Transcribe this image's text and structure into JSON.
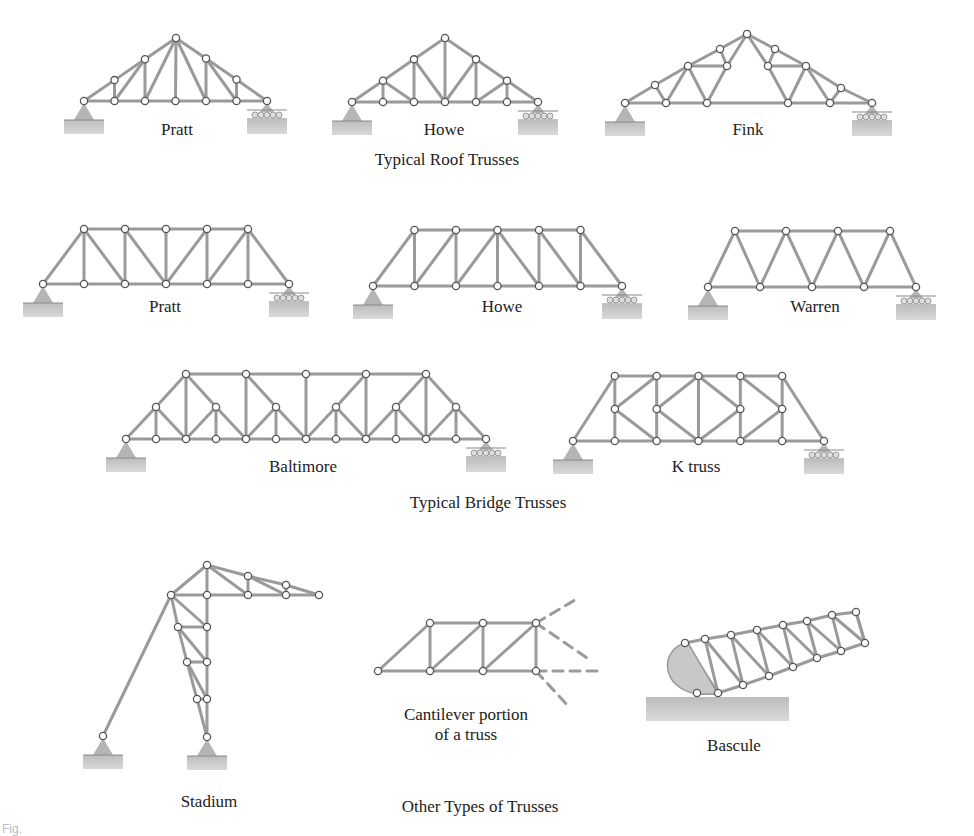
{
  "figure": {
    "caption_fragment": "Fig.",
    "sections": [
      {
        "id": "roof",
        "title": "Typical Roof Trusses",
        "trusses": [
          "Pratt",
          "Howe",
          "Fink"
        ]
      },
      {
        "id": "bridge",
        "title": "Typical Bridge Trusses",
        "trusses": [
          "Pratt",
          "Howe",
          "Warren",
          "Baltimore",
          "K truss"
        ]
      },
      {
        "id": "other",
        "title": "Other Types of Trusses",
        "trusses": [
          "Stadium",
          "Cantilever portion of a truss",
          "Bascule"
        ]
      }
    ]
  },
  "labels": {
    "roof_pratt": "Pratt",
    "roof_howe": "Howe",
    "roof_fink": "Fink",
    "roof_title": "Typical Roof Trusses",
    "bridge_pratt": "Pratt",
    "bridge_howe": "Howe",
    "bridge_warren": "Warren",
    "bridge_baltimore": "Baltimore",
    "bridge_ktruss": "K truss",
    "bridge_title": "Typical Bridge Trusses",
    "stadium": "Stadium",
    "cantilever_line1": "Cantilever portion",
    "cantilever_line2": "of a truss",
    "bascule": "Bascule",
    "other_title": "Other Types of Trusses"
  },
  "colors": {
    "member": "#9a9a9a",
    "joint_fill": "#ffffff",
    "joint_stroke": "#555555",
    "support": "#b5b5b5",
    "ground": "#c8c8c8",
    "text": "#222222"
  }
}
